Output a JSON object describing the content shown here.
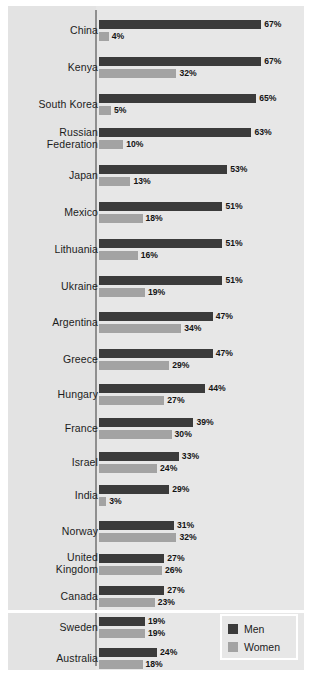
{
  "chart_data": {
    "type": "bar",
    "orientation": "horizontal",
    "title": "",
    "xlabel": "",
    "ylabel": "",
    "xlim": [
      0,
      70
    ],
    "grid": false,
    "value_format": "percent",
    "legend": {
      "position": "bottom-right",
      "entries": [
        {
          "name": "Men",
          "color": "#3b3b3b"
        },
        {
          "name": "Women",
          "color": "#a3a3a3"
        }
      ]
    },
    "categories": [
      "China",
      "Kenya",
      "South Korea",
      "Russian Federation",
      "Japan",
      "Mexico",
      "Lithuania",
      "Ukraine",
      "Argentina",
      "Greece",
      "Hungary",
      "France",
      "Israel",
      "India",
      "Norway",
      "United Kingdom",
      "Canada",
      "Sweden",
      "Australia",
      "United States"
    ],
    "series": [
      {
        "name": "Men",
        "color": "#3b3b3b",
        "values": [
          67,
          67,
          65,
          63,
          53,
          51,
          51,
          51,
          47,
          47,
          44,
          39,
          33,
          29,
          31,
          27,
          27,
          19,
          24,
          26
        ]
      },
      {
        "name": "Women",
        "color": "#a3a3a3",
        "values": [
          4,
          32,
          5,
          10,
          13,
          18,
          16,
          19,
          34,
          29,
          27,
          30,
          24,
          3,
          32,
          26,
          23,
          19,
          18,
          22
        ]
      }
    ],
    "data_labels": [
      {
        "category": "China",
        "men": "67%",
        "women": "4%"
      },
      {
        "category": "Kenya",
        "men": "67%",
        "women": "32%"
      },
      {
        "category": "South Korea",
        "men": "65%",
        "women": "5%"
      },
      {
        "category": "Russian Federation",
        "men": "63%",
        "women": "10%"
      },
      {
        "category": "Japan",
        "men": "53%",
        "women": "13%"
      },
      {
        "category": "Mexico",
        "men": "51%",
        "women": "18%"
      },
      {
        "category": "Lithuania",
        "men": "51%",
        "women": "16%"
      },
      {
        "category": "Ukraine",
        "men": "51%",
        "women": "19%"
      },
      {
        "category": "Argentina",
        "men": "47%",
        "women": "34%"
      },
      {
        "category": "Greece",
        "men": "47%",
        "women": "29%"
      },
      {
        "category": "Hungary",
        "men": "44%",
        "women": "27%"
      },
      {
        "category": "France",
        "men": "39%",
        "women": "30%"
      },
      {
        "category": "Israel",
        "men": "33%",
        "women": "24%"
      },
      {
        "category": "India",
        "men": "29%",
        "women": "3%"
      },
      {
        "category": "Norway",
        "men": "31%",
        "women": "32%"
      },
      {
        "category": "United Kingdom",
        "men": "27%",
        "women": "26%"
      },
      {
        "category": "Canada",
        "men": "27%",
        "women": "23%"
      },
      {
        "category": "Sweden",
        "men": "19%",
        "women": "19%"
      },
      {
        "category": "Australia",
        "men": "24%",
        "women": "18%"
      },
      {
        "category": "United States",
        "men": "26%",
        "women": "22%"
      }
    ],
    "highlighted_category": "United States"
  },
  "layout": {
    "rows": [
      {
        "label": "China",
        "label_lines": [
          "China"
        ],
        "top": 14,
        "label_top": 19
      },
      {
        "label": "Kenya",
        "label_lines": [
          "Kenya"
        ],
        "top": 51,
        "label_top": 56
      },
      {
        "label": "South Korea",
        "label_lines": [
          "South Korea"
        ],
        "top": 88,
        "label_top": 93
      },
      {
        "label": "Russian Federation",
        "label_lines": [
          "Russian",
          "Federation"
        ],
        "top": 122,
        "label_top": 121
      },
      {
        "label": "Japan",
        "label_lines": [
          "Japan"
        ],
        "top": 159,
        "label_top": 164
      },
      {
        "label": "Mexico",
        "label_lines": [
          "Mexico"
        ],
        "top": 196,
        "label_top": 201
      },
      {
        "label": "Lithuania",
        "label_lines": [
          "Lithuania"
        ],
        "top": 233,
        "label_top": 238
      },
      {
        "label": "Ukraine",
        "label_lines": [
          "Ukraine"
        ],
        "top": 270,
        "label_top": 275
      },
      {
        "label": "Argentina",
        "label_lines": [
          "Argentina"
        ],
        "top": 306,
        "label_top": 311
      },
      {
        "label": "Greece",
        "label_lines": [
          "Greece"
        ],
        "top": 343,
        "label_top": 348
      },
      {
        "label": "Hungary",
        "label_lines": [
          "Hungary"
        ],
        "top": 378,
        "label_top": 383
      },
      {
        "label": "France",
        "label_lines": [
          "France"
        ],
        "top": 412,
        "label_top": 417
      },
      {
        "label": "Israel",
        "label_lines": [
          "Israel"
        ],
        "top": 446,
        "label_top": 451
      },
      {
        "label": "India",
        "label_lines": [
          "India"
        ],
        "top": 479,
        "label_top": 484
      },
      {
        "label": "Norway",
        "label_lines": [
          "Norway"
        ],
        "top": 515,
        "label_top": 520
      },
      {
        "label": "United Kingdom",
        "label_lines": [
          "United",
          "Kingdom"
        ],
        "top": 548,
        "label_top": 546
      },
      {
        "label": "Canada",
        "label_lines": [
          "Canada"
        ],
        "top": 580,
        "label_top": 585
      },
      {
        "label": "Sweden",
        "label_lines": [
          "Sweden"
        ],
        "top": 611,
        "label_top": 616
      },
      {
        "label": "Australia",
        "label_lines": [
          "Australia"
        ],
        "top": 642,
        "label_top": 647
      },
      {
        "label": "United States",
        "label_lines": [
          "United States"
        ],
        "top": 687,
        "label_top": 692
      }
    ]
  }
}
